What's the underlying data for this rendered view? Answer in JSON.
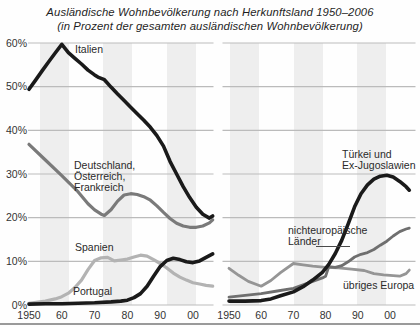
{
  "title": "Ausländische Wohnbevölkerung nach Herkunftsland 1950–2006",
  "subtitle": "(in Prozent der gesamten ausländischen Wohnbevölkerung)",
  "chart_data": {
    "type": "line",
    "title": "Ausländische Wohnbevölkerung nach Herkunftsland 1950–2006",
    "subtitle": "(in Prozent der gesamten ausländischen Wohnbevölkerung)",
    "ylabel": "Prozent",
    "ylim": [
      0,
      60
    ],
    "grid": true,
    "yticks": [
      "60%",
      "50%",
      "40%",
      "30%",
      "20%",
      "10%",
      "0%"
    ],
    "xticks": [
      "1950",
      "60",
      "70",
      "80",
      "90",
      "00"
    ],
    "x_range": [
      1950,
      2006
    ],
    "panels": [
      {
        "name": "left-panel",
        "series": [
          {
            "id": "spanien",
            "name": "Spanien",
            "label_lines": [
              "Spanien"
            ],
            "color": "#b3b3b3",
            "width": 3.2,
            "points": [
              [
                1950,
                0.4
              ],
              [
                1955,
                0.9
              ],
              [
                1958,
                1.4
              ],
              [
                1960,
                1.9
              ],
              [
                1962,
                2.7
              ],
              [
                1964,
                4.0
              ],
              [
                1966,
                5.7
              ],
              [
                1968,
                8.1
              ],
              [
                1970,
                10.2
              ],
              [
                1972,
                10.8
              ],
              [
                1974,
                10.9
              ],
              [
                1976,
                10.1
              ],
              [
                1978,
                10.3
              ],
              [
                1980,
                10.5
              ],
              [
                1982,
                11.0
              ],
              [
                1984,
                11.4
              ],
              [
                1986,
                11.2
              ],
              [
                1988,
                10.4
              ],
              [
                1990,
                9.5
              ],
              [
                1992,
                8.5
              ],
              [
                1994,
                7.3
              ],
              [
                1996,
                6.4
              ],
              [
                1998,
                5.7
              ],
              [
                2000,
                5.1
              ],
              [
                2002,
                4.8
              ],
              [
                2004,
                4.5
              ],
              [
                2006,
                4.3
              ]
            ]
          },
          {
            "id": "deutschland-oesterreich-frankreich",
            "name": "Deutschland, Österreich, Frankreich",
            "label_lines": [
              "Deutschland,",
              "Österreich,",
              "Frankreich"
            ],
            "color": "#7a7a7a",
            "width": 3.2,
            "points": [
              [
                1950,
                36.8
              ],
              [
                1955,
                33.2
              ],
              [
                1960,
                29.6
              ],
              [
                1965,
                25.9
              ],
              [
                1968,
                23.2
              ],
              [
                1970,
                21.8
              ],
              [
                1972,
                20.8
              ],
              [
                1973,
                20.5
              ],
              [
                1975,
                21.8
              ],
              [
                1977,
                23.8
              ],
              [
                1979,
                25.2
              ],
              [
                1981,
                25.5
              ],
              [
                1983,
                25.3
              ],
              [
                1985,
                24.8
              ],
              [
                1987,
                24.0
              ],
              [
                1989,
                22.7
              ],
              [
                1991,
                21.2
              ],
              [
                1993,
                19.8
              ],
              [
                1995,
                18.7
              ],
              [
                1997,
                18.1
              ],
              [
                1999,
                17.8
              ],
              [
                2001,
                17.8
              ],
              [
                2003,
                18.1
              ],
              [
                2005,
                18.8
              ],
              [
                2006,
                19.5
              ]
            ]
          },
          {
            "id": "portugal",
            "name": "Portugal",
            "label_lines": [
              "Portugal"
            ],
            "color": "#1a1a1a",
            "width": 3.6,
            "points": [
              [
                1950,
                0.2
              ],
              [
                1955,
                0.3
              ],
              [
                1960,
                0.3
              ],
              [
                1965,
                0.4
              ],
              [
                1970,
                0.5
              ],
              [
                1975,
                0.7
              ],
              [
                1978,
                0.9
              ],
              [
                1980,
                1.1
              ],
              [
                1982,
                1.7
              ],
              [
                1984,
                2.6
              ],
              [
                1986,
                4.3
              ],
              [
                1988,
                6.6
              ],
              [
                1990,
                8.8
              ],
              [
                1992,
                10.2
              ],
              [
                1994,
                10.7
              ],
              [
                1996,
                10.4
              ],
              [
                1998,
                9.9
              ],
              [
                2000,
                9.7
              ],
              [
                2002,
                10.1
              ],
              [
                2004,
                10.9
              ],
              [
                2006,
                11.7
              ]
            ]
          },
          {
            "id": "italien",
            "name": "Italien",
            "label_lines": [
              "Italien"
            ],
            "color": "#1a1a1a",
            "width": 3.6,
            "points": [
              [
                1950,
                49.4
              ],
              [
                1952,
                51.5
              ],
              [
                1954,
                53.6
              ],
              [
                1956,
                55.7
              ],
              [
                1958,
                57.7
              ],
              [
                1960,
                59.7
              ],
              [
                1962,
                57.8
              ],
              [
                1964,
                56.5
              ],
              [
                1966,
                55.2
              ],
              [
                1968,
                53.8
              ],
              [
                1970,
                52.7
              ],
              [
                1971,
                52.2
              ],
              [
                1973,
                51.6
              ],
              [
                1975,
                49.9
              ],
              [
                1977,
                48.3
              ],
              [
                1979,
                46.8
              ],
              [
                1981,
                45.3
              ],
              [
                1983,
                43.8
              ],
              [
                1985,
                42.3
              ],
              [
                1987,
                40.7
              ],
              [
                1989,
                38.8
              ],
              [
                1991,
                36.4
              ],
              [
                1993,
                32.9
              ],
              [
                1995,
                30.0
              ],
              [
                1997,
                27.1
              ],
              [
                1999,
                24.6
              ],
              [
                2001,
                22.4
              ],
              [
                2003,
                20.8
              ],
              [
                2005,
                19.9
              ],
              [
                2006,
                20.4
              ]
            ]
          }
        ]
      },
      {
        "name": "right-panel",
        "series": [
          {
            "id": "uebriges-europa",
            "name": "übriges Europa",
            "label_lines": [
              "übriges Europa"
            ],
            "color": "#959595",
            "width": 2.8,
            "points": [
              [
                1950,
                8.4
              ],
              [
                1953,
                6.8
              ],
              [
                1956,
                5.4
              ],
              [
                1960,
                4.3
              ],
              [
                1963,
                5.6
              ],
              [
                1966,
                7.4
              ],
              [
                1970,
                9.5
              ],
              [
                1973,
                9.2
              ],
              [
                1976,
                8.9
              ],
              [
                1980,
                8.6
              ],
              [
                1984,
                8.5
              ],
              [
                1988,
                8.2
              ],
              [
                1992,
                7.9
              ],
              [
                1995,
                7.2
              ],
              [
                1998,
                6.9
              ],
              [
                2001,
                6.7
              ],
              [
                2003,
                6.6
              ],
              [
                2005,
                7.2
              ],
              [
                2006,
                8.0
              ]
            ]
          },
          {
            "id": "nichteuropaeische-laender",
            "name": "nichteuropäische Länder",
            "label_lines": [
              "nichteuropäische",
              "Länder"
            ],
            "color": "#6f6f6f",
            "width": 2.8,
            "points": [
              [
                1950,
                1.8
              ],
              [
                1955,
                2.2
              ],
              [
                1960,
                2.6
              ],
              [
                1965,
                3.2
              ],
              [
                1970,
                3.8
              ],
              [
                1973,
                4.6
              ],
              [
                1976,
                5.4
              ],
              [
                1979,
                6.2
              ],
              [
                1980,
                6.6
              ],
              [
                1981,
                8.8
              ],
              [
                1983,
                8.6
              ],
              [
                1985,
                9.0
              ],
              [
                1987,
                9.9
              ],
              [
                1989,
                11.0
              ],
              [
                1991,
                11.6
              ],
              [
                1993,
                12.0
              ],
              [
                1995,
                12.7
              ],
              [
                1997,
                13.7
              ],
              [
                1999,
                14.6
              ],
              [
                2001,
                15.8
              ],
              [
                2003,
                16.8
              ],
              [
                2005,
                17.4
              ],
              [
                2006,
                17.6
              ]
            ]
          },
          {
            "id": "tuerkei-ex-jugoslawien",
            "name": "Türkei und Ex-Jugoslawien",
            "label_lines": [
              "Türkei und",
              "Ex-Jugoslawien"
            ],
            "color": "#1a1a1a",
            "width": 3.6,
            "points": [
              [
                1950,
                0.9
              ],
              [
                1955,
                0.9
              ],
              [
                1960,
                1.0
              ],
              [
                1963,
                1.4
              ],
              [
                1966,
                2.1
              ],
              [
                1970,
                3.0
              ],
              [
                1973,
                4.2
              ],
              [
                1976,
                5.7
              ],
              [
                1979,
                7.5
              ],
              [
                1981,
                9.3
              ],
              [
                1983,
                11.8
              ],
              [
                1985,
                14.8
              ],
              [
                1987,
                18.5
              ],
              [
                1989,
                22.5
              ],
              [
                1991,
                25.5
              ],
              [
                1993,
                27.5
              ],
              [
                1995,
                28.8
              ],
              [
                1997,
                29.5
              ],
              [
                1999,
                29.7
              ],
              [
                2001,
                29.3
              ],
              [
                2003,
                28.3
              ],
              [
                2005,
                27.1
              ],
              [
                2006,
                26.3
              ]
            ]
          }
        ]
      }
    ]
  }
}
